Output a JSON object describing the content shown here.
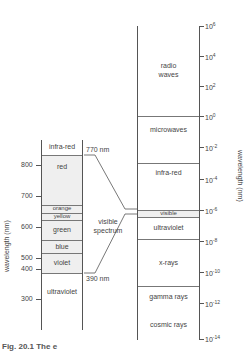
{
  "left_scale": {
    "axis_label": "wavelength (nm)",
    "ticks": [
      "800",
      "700",
      "600",
      "500",
      "400",
      "300"
    ],
    "bands": [
      "infra-red",
      "red",
      "orange",
      "yellow",
      "green",
      "blue",
      "violet",
      "ultraviolet"
    ],
    "markers": {
      "top": "770 nm",
      "bottom": "390 nm"
    }
  },
  "middle_label": {
    "line1": "visible",
    "line2": "spectrum"
  },
  "right_scale": {
    "axis_label": "wavelength (nm)",
    "ticks": [
      {
        "base": "10",
        "exp": "6"
      },
      {
        "base": "10",
        "exp": "4"
      },
      {
        "base": "10",
        "exp": "2"
      },
      {
        "base": "10",
        "exp": "0"
      },
      {
        "base": "10",
        "exp": "-2"
      },
      {
        "base": "10",
        "exp": "-4"
      },
      {
        "base": "10",
        "exp": "-6"
      },
      {
        "base": "10",
        "exp": "-8"
      },
      {
        "base": "10",
        "exp": "-10"
      },
      {
        "base": "10",
        "exp": "-12"
      },
      {
        "base": "10",
        "exp": "-14"
      }
    ],
    "bands": [
      {
        "line1": "radio",
        "line2": "waves"
      },
      {
        "line1": "microwaves"
      },
      {
        "line1": "infra-red"
      },
      {
        "line1": "visible"
      },
      {
        "line1": "ultraviolet"
      },
      {
        "line1": "x-rays"
      },
      {
        "line1": "gamma rays"
      },
      {
        "line1": "cosmic rays"
      }
    ]
  },
  "caption": "Fig. 20.1  The e"
}
